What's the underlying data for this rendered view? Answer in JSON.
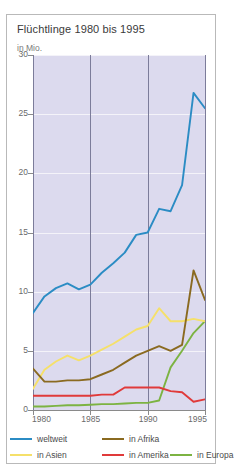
{
  "card": {
    "title": "Flüchtlinge 1980 bis 1995",
    "unit": "in Mio."
  },
  "legend": [
    {
      "label": "weltweit",
      "color": "#2b8cc4",
      "row": 0,
      "col": 0
    },
    {
      "label": "in Afrika",
      "color": "#8a6a20",
      "row": 0,
      "col": 1
    },
    {
      "label": "in Asien",
      "color": "#f5e06a",
      "row": 1,
      "col": 0
    },
    {
      "label": "in Amerika",
      "color": "#e03a3a",
      "row": 1,
      "col": 1
    },
    {
      "label": "in Europa",
      "color": "#7cb342",
      "row": 1,
      "col": 2
    }
  ],
  "chart_data": {
    "type": "line",
    "title": "Flüchtlinge 1980 bis 1995",
    "xlabel": "",
    "ylabel": "in Mio.",
    "xlim": [
      1980,
      1995
    ],
    "ylim": [
      0,
      30
    ],
    "yticks": [
      0,
      5,
      10,
      15,
      20,
      25,
      30
    ],
    "xticks": [
      1980,
      1985,
      1990,
      1995
    ],
    "grid": true,
    "legend_position": "bottom",
    "x": [
      1980,
      1981,
      1982,
      1983,
      1984,
      1985,
      1986,
      1987,
      1988,
      1989,
      1990,
      1991,
      1992,
      1993,
      1994,
      1995
    ],
    "series": [
      {
        "name": "weltweit",
        "color": "#2b8cc4",
        "values": [
          8.2,
          9.6,
          10.3,
          10.7,
          10.2,
          10.6,
          11.6,
          12.4,
          13.3,
          14.8,
          15.0,
          17.0,
          16.8,
          19.0,
          26.8,
          25.5
        ]
      },
      {
        "name": "in Afrika",
        "color": "#8a6a20",
        "values": [
          3.5,
          2.4,
          2.4,
          2.5,
          2.5,
          2.6,
          3.0,
          3.4,
          4.0,
          4.6,
          5.0,
          5.4,
          5.0,
          5.5,
          11.8,
          9.3
        ]
      },
      {
        "name": "in Asien",
        "color": "#f5e06a",
        "values": [
          1.8,
          3.4,
          4.1,
          4.6,
          4.2,
          4.6,
          5.1,
          5.6,
          6.2,
          6.8,
          7.1,
          8.6,
          7.5,
          7.5,
          7.7,
          7.5
        ]
      },
      {
        "name": "in Amerika",
        "color": "#e03a3a",
        "values": [
          1.2,
          1.2,
          1.2,
          1.2,
          1.2,
          1.2,
          1.3,
          1.3,
          1.9,
          1.9,
          1.9,
          1.9,
          1.6,
          1.5,
          0.7,
          0.9
        ]
      },
      {
        "name": "in Europa",
        "color": "#7cb342",
        "values": [
          0.3,
          0.3,
          0.35,
          0.4,
          0.4,
          0.45,
          0.5,
          0.5,
          0.55,
          0.6,
          0.6,
          0.8,
          3.6,
          5.0,
          6.5,
          7.5
        ]
      }
    ]
  }
}
